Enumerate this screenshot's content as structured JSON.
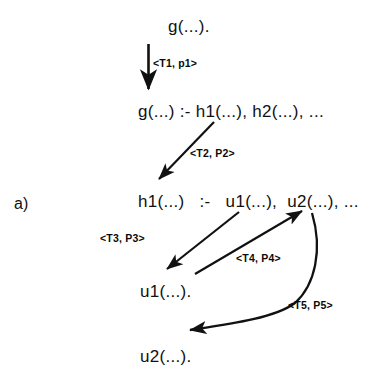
{
  "figure": {
    "panel_label": "a)",
    "nodes": [
      {
        "id": "goal",
        "text": "g(...).",
        "x": 168,
        "y": 18
      },
      {
        "id": "g-clause",
        "text": "g(...) :- h1(...), h2(...), ...",
        "x": 138,
        "y": 103
      },
      {
        "id": "h1-clause",
        "text": "h1(...)   :-   u1(...),  u2(...), ...",
        "x": 138,
        "y": 193
      },
      {
        "id": "u1-fact",
        "text": "u1(...).",
        "x": 140,
        "y": 283
      },
      {
        "id": "u2-fact",
        "text": "u2(...).",
        "x": 140,
        "y": 348
      }
    ],
    "edges": [
      {
        "id": "t1",
        "label": "<T1, p1>",
        "label_x": 153,
        "label_y": 58,
        "kind": "straight-down"
      },
      {
        "id": "t2",
        "label": "<T2, P2>",
        "label_x": 190,
        "label_y": 148,
        "kind": "diagonal-down-left"
      },
      {
        "id": "t3",
        "label": "<T3, P3>",
        "label_x": 100,
        "label_y": 233,
        "kind": "diagonal-down-left"
      },
      {
        "id": "t4",
        "label": "<T4, P4>",
        "label_x": 236,
        "label_y": 253,
        "kind": "diagonal-up-right"
      },
      {
        "id": "t5",
        "label": "<T5, P5>",
        "label_x": 288,
        "label_y": 300,
        "kind": "curved-down-left"
      }
    ],
    "colors": {
      "ink": "#111111",
      "background": "#ffffff"
    }
  }
}
